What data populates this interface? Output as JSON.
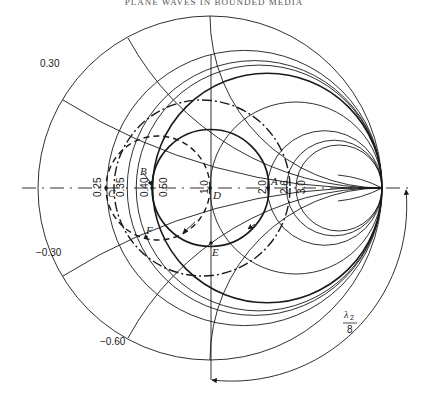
{
  "header": {
    "running_title": "PLANE WAVES IN BOUNDED MEDIA"
  },
  "diagram": {
    "type": "smith-chart",
    "center": [
      210,
      188
    ],
    "outer_radius": 172,
    "resistance_labels": [
      {
        "text": "0.25",
        "x": 94
      },
      {
        "text": "0.35",
        "x": 118
      },
      {
        "text": "0.40",
        "x": 142
      },
      {
        "text": "0.50",
        "x": 163
      },
      {
        "text": "1.0",
        "x": 205
      },
      {
        "text": "2.0",
        "x": 262
      },
      {
        "text": "2.6",
        "x": 284
      },
      {
        "text": "3.0",
        "x": 303
      }
    ],
    "reactance_labels": [
      {
        "text": "0.30",
        "x": 40,
        "y": 67
      },
      {
        "text": "−0.30",
        "x": 36,
        "y": 256
      },
      {
        "text": "−0.60",
        "x": 100,
        "y": 345
      }
    ],
    "points": [
      {
        "label": "A",
        "x": 269,
        "y": 188
      },
      {
        "label": "B",
        "x": 152,
        "y": 188
      },
      {
        "label": "C",
        "x": 106,
        "y": 188
      },
      {
        "label": "D",
        "x": 210,
        "y": 188
      },
      {
        "label": "E",
        "x": 211,
        "y": 243
      },
      {
        "label": "F",
        "x": 146,
        "y": 237
      }
    ],
    "wavelength_annotation": {
      "numerator": "λ",
      "subscript": "2",
      "denominator": "8"
    }
  }
}
